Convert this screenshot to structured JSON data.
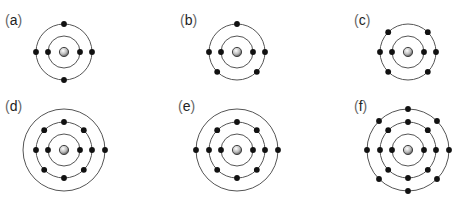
{
  "diagram": {
    "type": "atomic-electron-shell-models",
    "colors": {
      "shell": "#555555",
      "electron": "#111111",
      "nucleus_fill": "#bbbbbb",
      "nucleus_stroke": "#444444"
    },
    "panels": [
      {
        "label": "a",
        "cx": 64,
        "cy": 52,
        "lx": 5,
        "ly": 25,
        "shells": [
          {
            "r": 16,
            "electrons": 2,
            "angles": [
              0,
              180
            ]
          },
          {
            "r": 28,
            "electrons": 4,
            "angles": [
              0,
              90,
              180,
              270
            ]
          }
        ]
      },
      {
        "label": "b",
        "cx": 237,
        "cy": 52,
        "lx": 180,
        "ly": 25,
        "shells": [
          {
            "r": 16,
            "electrons": 2,
            "angles": [
              0,
              180
            ]
          },
          {
            "r": 28,
            "electrons": 5,
            "angles": [
              -90,
              0,
              180,
              45,
              135
            ]
          }
        ]
      },
      {
        "label": "c",
        "cx": 408,
        "cy": 52,
        "lx": 354,
        "ly": 25,
        "shells": [
          {
            "r": 16,
            "electrons": 2,
            "angles": [
              0,
              180
            ]
          },
          {
            "r": 28,
            "electrons": 6,
            "angles": [
              0,
              180,
              -45,
              -135,
              45,
              135
            ]
          }
        ]
      },
      {
        "label": "d",
        "cx": 64,
        "cy": 150,
        "lx": 5,
        "ly": 111,
        "shells": [
          {
            "r": 16,
            "electrons": 2,
            "angles": [
              0,
              180
            ]
          },
          {
            "r": 28,
            "electrons": 8,
            "angles": [
              0,
              45,
              90,
              135,
              180,
              225,
              270,
              315
            ]
          },
          {
            "r": 41,
            "electrons": 1,
            "angles": [
              0
            ]
          }
        ]
      },
      {
        "label": "e",
        "cx": 237,
        "cy": 150,
        "lx": 178,
        "ly": 111,
        "shells": [
          {
            "r": 16,
            "electrons": 2,
            "angles": [
              0,
              180
            ]
          },
          {
            "r": 28,
            "electrons": 8,
            "angles": [
              0,
              45,
              90,
              135,
              180,
              225,
              270,
              315
            ]
          },
          {
            "r": 41,
            "electrons": 2,
            "angles": [
              0,
              180
            ]
          }
        ]
      },
      {
        "label": "f",
        "cx": 408,
        "cy": 150,
        "lx": 354,
        "ly": 111,
        "shells": [
          {
            "r": 16,
            "electrons": 2,
            "angles": [
              0,
              180
            ]
          },
          {
            "r": 28,
            "electrons": 8,
            "angles": [
              0,
              45,
              90,
              135,
              180,
              225,
              270,
              315
            ]
          },
          {
            "r": 41,
            "electrons": 8,
            "angles": [
              0,
              45,
              90,
              135,
              180,
              225,
              270,
              315
            ]
          }
        ]
      }
    ]
  }
}
